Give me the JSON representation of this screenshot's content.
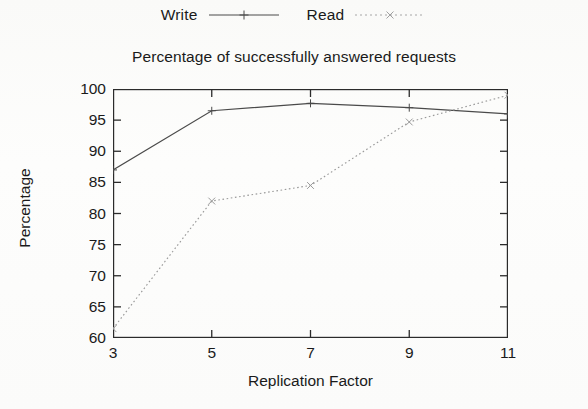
{
  "chart_data": {
    "type": "line",
    "title": "Percentage of successfully answered requests",
    "xlabel": "Replication Factor",
    "ylabel": "Percentage",
    "x": [
      3,
      5,
      7,
      9,
      11
    ],
    "xtick_labels": [
      "3",
      "5",
      "7",
      "9",
      "11"
    ],
    "ytick_labels": [
      "60",
      "65",
      "70",
      "75",
      "80",
      "85",
      "90",
      "95",
      "100"
    ],
    "yticks": [
      60,
      65,
      70,
      75,
      80,
      85,
      90,
      95,
      100
    ],
    "xlim": [
      3,
      11
    ],
    "ylim": [
      60,
      100
    ],
    "grid": false,
    "legend_position": "top-center",
    "series": [
      {
        "name": "Write",
        "values": [
          87.0,
          96.5,
          97.7,
          97.0,
          96.0
        ],
        "line_style": "solid",
        "marker": "plus",
        "color": "#4a4a4a"
      },
      {
        "name": "Read",
        "values": [
          61.5,
          82.0,
          84.5,
          94.7,
          99.0
        ],
        "line_style": "dotted",
        "marker": "cross",
        "color": "#9a9a9a"
      }
    ]
  },
  "axis_color": "#2b2b2b"
}
